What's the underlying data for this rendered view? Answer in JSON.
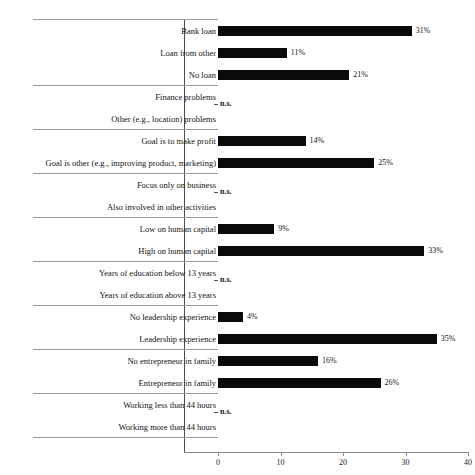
{
  "figure": {
    "top_clip_text": "",
    "not_significant_label": "n.s."
  },
  "chart_data": {
    "type": "bar",
    "orientation": "horizontal",
    "title": "",
    "xlabel": "",
    "ylabel": "",
    "xlim": [
      0,
      40
    ],
    "xticks": [
      0,
      10,
      20,
      30,
      40
    ],
    "xtick_labels": [
      "0",
      "10",
      "20",
      "30",
      "40"
    ],
    "grid": false,
    "legend": null,
    "value_suffix": "%",
    "bar_color": "#0a0a0a",
    "not_significant_marker": "n.s.",
    "groups": [
      {
        "name": "loan",
        "significant": true,
        "categories": [
          "Bank loan",
          "Loan from other",
          "No loan"
        ],
        "values": [
          31,
          11,
          21
        ],
        "labels": [
          "31%",
          "11%",
          "21%"
        ]
      },
      {
        "name": "problems",
        "significant": false,
        "categories": [
          "Finance problems",
          "Other (e.g., location) problems"
        ],
        "values": [
          null,
          null
        ],
        "labels": [
          "",
          ""
        ]
      },
      {
        "name": "goal",
        "significant": true,
        "categories": [
          "Goal is to make profit",
          "Goal is other (e.g., improving product, marketing)"
        ],
        "values": [
          14,
          25
        ],
        "labels": [
          "14%",
          "25%"
        ]
      },
      {
        "name": "focus",
        "significant": false,
        "categories": [
          "Focus only on business",
          "Also involved in other activities"
        ],
        "values": [
          null,
          null
        ],
        "labels": [
          "",
          ""
        ]
      },
      {
        "name": "human-capital",
        "significant": true,
        "categories": [
          "Low on human capital",
          "High on human capital"
        ],
        "values": [
          9,
          33
        ],
        "labels": [
          "9%",
          "33%"
        ]
      },
      {
        "name": "education",
        "significant": false,
        "categories": [
          "Years of education below 13 years",
          "Years of education above 13 years"
        ],
        "values": [
          null,
          null
        ],
        "labels": [
          "",
          ""
        ]
      },
      {
        "name": "leadership",
        "significant": true,
        "categories": [
          "No leadership experience",
          "Leadership experience"
        ],
        "values": [
          4,
          35
        ],
        "labels": [
          "4%",
          "35%"
        ]
      },
      {
        "name": "family",
        "significant": true,
        "categories": [
          "No entrepreneur in family",
          "Entrepreneur in family"
        ],
        "values": [
          16,
          26
        ],
        "labels": [
          "16%",
          "26%"
        ]
      },
      {
        "name": "hours",
        "significant": false,
        "categories": [
          "Working less than 44 hours",
          "Working more than 44 hours"
        ],
        "values": [
          null,
          null
        ],
        "labels": [
          "",
          ""
        ]
      }
    ]
  }
}
